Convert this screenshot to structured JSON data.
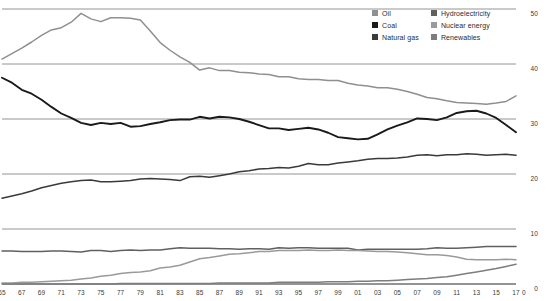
{
  "chart_data": {
    "type": "line",
    "title": "",
    "subtitle": "",
    "xlabel": "",
    "ylabel": "",
    "xlim": [
      1965,
      2017
    ],
    "ylim": [
      0,
      50
    ],
    "grid": true,
    "gridlines_y": [
      0,
      10,
      20,
      30,
      40,
      50
    ],
    "legend_position": "top-right",
    "y_ticks": [
      "50",
      "40",
      "30",
      "20",
      "10",
      "0"
    ],
    "y_tick_values": [
      50,
      40,
      30,
      20,
      10,
      0
    ],
    "x_ticks": [
      "65",
      "67",
      "69",
      "71",
      "73",
      "75",
      "77",
      "79",
      "81",
      "83",
      "85",
      "87",
      "89",
      "91",
      "93",
      "95",
      "97",
      "99",
      "01",
      "03",
      "05",
      "07",
      "09",
      "11",
      "13",
      "15",
      "17"
    ],
    "x_tick_values": [
      1965,
      1967,
      1969,
      1971,
      1973,
      1975,
      1977,
      1979,
      1981,
      1983,
      1985,
      1987,
      1989,
      1991,
      1993,
      1995,
      1997,
      1999,
      2001,
      2003,
      2005,
      2007,
      2009,
      2011,
      2013,
      2015,
      2017
    ],
    "x": [
      1965,
      1966,
      1967,
      1968,
      1969,
      1970,
      1971,
      1972,
      1973,
      1974,
      1975,
      1976,
      1977,
      1978,
      1979,
      1980,
      1981,
      1982,
      1983,
      1984,
      1985,
      1986,
      1987,
      1988,
      1989,
      1990,
      1991,
      1992,
      1993,
      1994,
      1995,
      1996,
      1997,
      1998,
      1999,
      2000,
      2001,
      2002,
      2003,
      2004,
      2005,
      2006,
      2007,
      2008,
      2009,
      2010,
      2011,
      2012,
      2013,
      2014,
      2015,
      2016,
      2017
    ],
    "series": [
      {
        "name": "Oil",
        "color": "#8f8f8f",
        "values": [
          40.9,
          41.9,
          42.9,
          44.0,
          45.2,
          46.2,
          46.6,
          47.6,
          49.2,
          48.2,
          47.7,
          48.4,
          48.4,
          48.3,
          48.0,
          46.0,
          43.9,
          42.5,
          41.3,
          40.3,
          38.9,
          39.3,
          38.8,
          38.8,
          38.5,
          38.4,
          38.2,
          38.1,
          37.7,
          37.7,
          37.3,
          37.2,
          37.2,
          37.0,
          37.0,
          36.5,
          36.2,
          36.0,
          35.7,
          35.7,
          35.4,
          35.0,
          34.5,
          33.9,
          33.7,
          33.3,
          33.0,
          32.9,
          32.8,
          32.7,
          32.9,
          33.2,
          34.2
        ]
      },
      {
        "name": "Coal",
        "color": "#1a1a1a",
        "values": [
          37.5,
          36.6,
          35.3,
          34.6,
          33.5,
          32.2,
          31.0,
          30.2,
          29.3,
          28.9,
          29.3,
          29.1,
          29.3,
          28.6,
          28.7,
          29.1,
          29.4,
          29.8,
          29.9,
          29.9,
          30.4,
          30.1,
          30.4,
          30.3,
          30.0,
          29.5,
          28.9,
          28.3,
          28.3,
          28.0,
          28.2,
          28.4,
          28.1,
          27.5,
          26.7,
          26.5,
          26.3,
          26.4,
          27.2,
          28.1,
          28.8,
          29.4,
          30.1,
          30.0,
          29.8,
          30.3,
          31.1,
          31.4,
          31.5,
          31.0,
          30.2,
          28.9,
          27.6
        ]
      },
      {
        "name": "Natural gas",
        "color": "#3a3a3a",
        "values": [
          15.6,
          16.0,
          16.4,
          16.9,
          17.5,
          17.9,
          18.3,
          18.6,
          18.8,
          18.9,
          18.6,
          18.6,
          18.7,
          18.8,
          19.1,
          19.2,
          19.1,
          19.0,
          18.8,
          19.5,
          19.6,
          19.4,
          19.7,
          20.0,
          20.4,
          20.6,
          20.9,
          21.0,
          21.2,
          21.1,
          21.4,
          21.9,
          21.7,
          21.7,
          22.0,
          22.2,
          22.4,
          22.7,
          22.8,
          22.8,
          22.9,
          23.1,
          23.4,
          23.5,
          23.3,
          23.5,
          23.5,
          23.7,
          23.6,
          23.4,
          23.5,
          23.6,
          23.4
        ]
      },
      {
        "name": "Hydroelectricity",
        "color": "#606060",
        "values": [
          6.0,
          6.0,
          5.9,
          5.9,
          5.9,
          6.0,
          6.0,
          5.9,
          5.8,
          6.1,
          6.1,
          5.9,
          6.1,
          6.2,
          6.1,
          6.2,
          6.2,
          6.4,
          6.6,
          6.5,
          6.5,
          6.5,
          6.4,
          6.4,
          6.3,
          6.4,
          6.4,
          6.3,
          6.6,
          6.5,
          6.6,
          6.6,
          6.5,
          6.5,
          6.5,
          6.5,
          6.2,
          6.3,
          6.3,
          6.3,
          6.3,
          6.3,
          6.3,
          6.4,
          6.6,
          6.5,
          6.5,
          6.6,
          6.7,
          6.8,
          6.8,
          6.8,
          6.8
        ]
      },
      {
        "name": "Nuclear energy",
        "color": "#9a9a9a",
        "values": [
          0.2,
          0.2,
          0.3,
          0.3,
          0.4,
          0.5,
          0.6,
          0.7,
          0.9,
          1.1,
          1.4,
          1.6,
          1.9,
          2.1,
          2.2,
          2.4,
          2.9,
          3.1,
          3.4,
          4.0,
          4.6,
          4.8,
          5.1,
          5.4,
          5.5,
          5.7,
          5.9,
          5.9,
          6.1,
          6.1,
          6.1,
          6.2,
          6.1,
          6.1,
          6.2,
          6.1,
          6.1,
          6.0,
          5.9,
          5.9,
          5.8,
          5.7,
          5.5,
          5.3,
          5.3,
          5.2,
          4.9,
          4.5,
          4.4,
          4.4,
          4.4,
          4.5,
          4.4
        ]
      },
      {
        "name": "Renewables",
        "color": "#7d7d7d",
        "values": [
          0.0,
          0.0,
          0.0,
          0.0,
          0.0,
          0.0,
          0.0,
          0.0,
          0.0,
          0.0,
          0.0,
          0.0,
          0.1,
          0.1,
          0.1,
          0.1,
          0.1,
          0.1,
          0.1,
          0.1,
          0.1,
          0.1,
          0.2,
          0.2,
          0.2,
          0.2,
          0.2,
          0.2,
          0.3,
          0.3,
          0.3,
          0.3,
          0.3,
          0.4,
          0.4,
          0.4,
          0.5,
          0.5,
          0.6,
          0.6,
          0.7,
          0.8,
          0.9,
          1.0,
          1.2,
          1.3,
          1.6,
          1.9,
          2.2,
          2.5,
          2.8,
          3.2,
          3.6
        ]
      }
    ]
  },
  "legend": {
    "left_column": [
      {
        "label": "Oil",
        "color": "#8f8f8f"
      },
      {
        "label": "Coal",
        "color": "#1a1a1a"
      },
      {
        "label": "Natural gas",
        "color": "#3a3a3a"
      }
    ],
    "right_column": [
      {
        "label": "Hydroelectricity",
        "color": "#606060"
      },
      {
        "label": "Nuclear energy",
        "color": "#9a9a9a"
      },
      {
        "label": "Renewables",
        "color": "#7d7d7d"
      }
    ]
  }
}
